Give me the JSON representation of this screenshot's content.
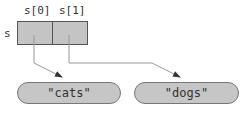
{
  "variable": {
    "name": "s"
  },
  "cells": [
    {
      "label": "s[0]"
    },
    {
      "label": "s[1]"
    }
  ],
  "strings": [
    {
      "value": "\"cats\""
    },
    {
      "value": "\"dogs\""
    }
  ],
  "colors": {
    "box_fill": "#c4c4c4",
    "pill_fill": "#c6c6c6",
    "stroke": "#555555",
    "arrow": "#999999"
  }
}
